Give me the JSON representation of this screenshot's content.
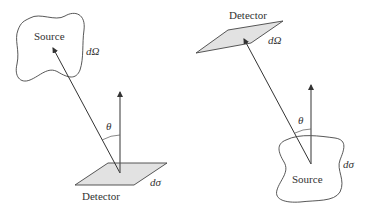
{
  "left_panel": {
    "source_label": "Source",
    "source_measure": "dΩ",
    "detector_label": "Detector",
    "detector_measure": "dσ",
    "angle_label": "θ"
  },
  "right_panel": {
    "detector_label": "Detector",
    "detector_measure": "dΩ",
    "source_label": "Source",
    "source_measure": "dσ",
    "angle_label": "θ"
  },
  "colors": {
    "line": "#333333",
    "plate_fill": "#e2e2e2",
    "background": "#ffffff"
  }
}
